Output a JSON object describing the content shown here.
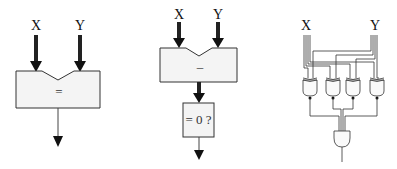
{
  "diagrams": {
    "equality_block": {
      "input_x_label": "X",
      "input_y_label": "Y",
      "operator": "="
    },
    "subtract_zero_test": {
      "input_x_label": "X",
      "input_y_label": "Y",
      "operator": "–",
      "test_label": "= 0 ?"
    },
    "gate_level_comparator": {
      "input_x_label": "X",
      "input_y_label": "Y",
      "xnor_gate_count": 4,
      "and_gate_count": 1
    }
  },
  "colors": {
    "stroke": "#222222",
    "box_fill": "#f4f4f4",
    "wire": "#333333"
  }
}
